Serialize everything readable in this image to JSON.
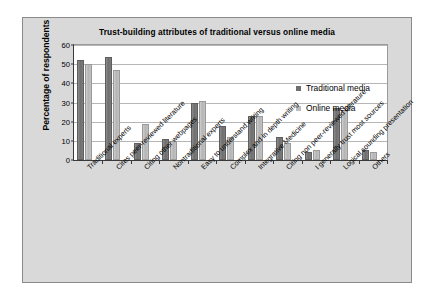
{
  "chart_data": {
    "type": "bar",
    "title": "Trust-building attributes of traditional versus online media",
    "xlabel": "",
    "ylabel": "Percentage of respondents",
    "ylim": [
      0,
      60
    ],
    "ytick_step": 10,
    "yticks": [
      0,
      10,
      20,
      30,
      40,
      50,
      60
    ],
    "grid": true,
    "legend_position": "inside-top-right",
    "categories": [
      "Traditional experts",
      "Cites peer-reviewed literature",
      "Citing other webpages",
      "Nontraditional experts",
      "Easy to understand writing",
      "Complex and in depth writing",
      "Integrative Medicine",
      "Citing non peer-reviewed literature",
      "I generally trust most sources",
      "Logical sounding presentation",
      "Others"
    ],
    "series": [
      {
        "name": "Traditional media",
        "color": "#6f6f6f",
        "values": [
          52,
          54,
          9,
          11,
          30,
          18,
          23,
          12,
          4,
          27,
          5
        ]
      },
      {
        "name": "Online media",
        "color": "#bcbcbc",
        "values": [
          50,
          47,
          19,
          10,
          31,
          12,
          23,
          9,
          5,
          26,
          4
        ]
      }
    ]
  }
}
